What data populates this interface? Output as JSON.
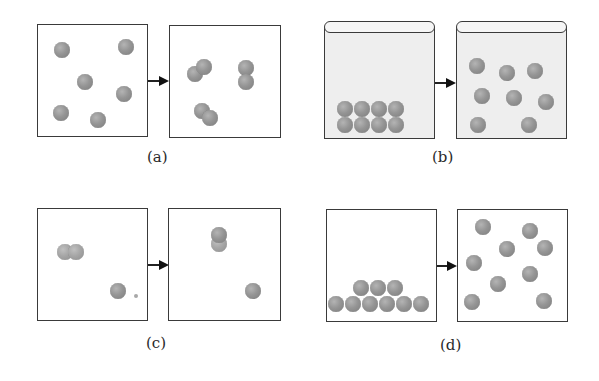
{
  "figure": {
    "ball_color": "#8a8a8a",
    "border_color": "#3a3a3a",
    "panels": [
      {
        "id": "a",
        "label": "(a)"
      },
      {
        "id": "b",
        "label": "(b)"
      },
      {
        "id": "c",
        "label": "(c)"
      },
      {
        "id": "d",
        "label": "(d)"
      }
    ]
  }
}
